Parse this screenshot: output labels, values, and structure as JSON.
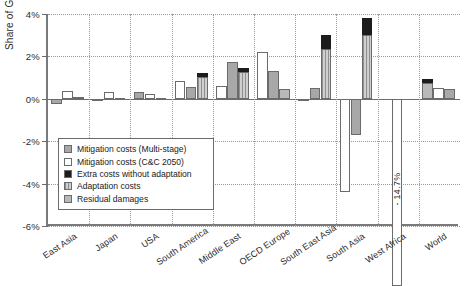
{
  "chart_data": {
    "type": "bar",
    "title": "",
    "xlabel": "",
    "ylabel": "Share of GDP",
    "ylim": [
      -6,
      4
    ],
    "ytick_labels": [
      "4%",
      "2%",
      "0%",
      "-2%",
      "-4%",
      "-6%"
    ],
    "ytick_values": [
      4,
      2,
      0,
      -2,
      -4,
      -6
    ],
    "grid": true,
    "legend_position": "lower-left-inside",
    "categories": [
      "East Asia",
      "Japan",
      "USA",
      "South America",
      "Middle East",
      "OECD Europe",
      "South East Asia",
      "South Asia",
      "West Africa",
      "World"
    ],
    "legend": [
      {
        "label": "Mitigation costs (Multi-stage)",
        "key": "mitms",
        "color": "#a8a8a8"
      },
      {
        "label": "Mitigation costs (C&C 2050)",
        "key": "cc",
        "color": "#ffffff"
      },
      {
        "label": "Extra costs without adaptation",
        "key": "extra",
        "color": "#1c1c1c"
      },
      {
        "label": "Adaptation costs",
        "key": "adapt",
        "color": "#cfcfcf"
      },
      {
        "label": "Residual damages",
        "key": "resid",
        "color": "#b9b9b9"
      }
    ],
    "series": [
      {
        "name": "Mitigation costs (Multi-stage)",
        "key": "mitms",
        "values": [
          -0.25,
          -0.08,
          0.25,
          0.55,
          0.8,
          0.5,
          0.5,
          -1.7,
          0.05,
          0.45
        ]
      },
      {
        "name": "Mitigation costs (C&C 2050)",
        "key": "cc",
        "values": [
          0.35,
          0.3,
          0.85,
          0.0,
          1.75,
          1.15,
          -0.1,
          -4.4,
          -14.7,
          0.5
        ]
      },
      {
        "name": "Adaptation costs",
        "key": "adapt",
        "values": [
          0.0,
          0.0,
          0.0,
          0.85,
          1.2,
          1.45,
          2.7,
          3.1,
          0.0,
          0.0
        ]
      },
      {
        "name": "Residual damages",
        "key": "resid",
        "values": [
          0.0,
          0.0,
          0.0,
          0.0,
          0.0,
          0.0,
          0.0,
          0.0,
          0.0,
          0.85
        ]
      },
      {
        "name": "Extra costs without adaptation",
        "key": "extra",
        "values": [
          0.0,
          0.0,
          0.0,
          0.0,
          0.35,
          0.2,
          0.9,
          0.7,
          0.0,
          0.2
        ]
      }
    ],
    "groups": [
      {
        "category": "East Asia",
        "bars": [
          {
            "key": "mitms",
            "base": 0,
            "top": -0.25
          },
          {
            "key": "cc",
            "base": 0,
            "top": 0.35
          },
          {
            "key": "resid",
            "base": 0,
            "top": 0.1
          }
        ]
      },
      {
        "category": "Japan",
        "bars": [
          {
            "key": "mitms",
            "base": 0,
            "top": -0.05
          },
          {
            "key": "cc",
            "base": 0,
            "top": 0.3
          },
          {
            "key": "resid",
            "base": 0,
            "top": 0.05
          }
        ]
      },
      {
        "category": "USA",
        "bars": [
          {
            "key": "mitms",
            "base": 0,
            "top": 0.3
          },
          {
            "key": "cc",
            "base": 0,
            "top": 0.25
          },
          {
            "key": "resid",
            "base": 0,
            "top": 0.05
          }
        ]
      },
      {
        "category": "South America",
        "bars": [
          {
            "key": "cc",
            "base": 0,
            "top": 0.85
          },
          {
            "key": "mitms",
            "base": 0,
            "top": 0.55
          },
          {
            "key": "stack_adapt_extra",
            "base": 0,
            "adapt_top": 1.05,
            "extra_top": 1.2
          }
        ]
      },
      {
        "category": "Middle East",
        "bars": [
          {
            "key": "cc",
            "base": 0,
            "top": 0.6
          },
          {
            "key": "mitms",
            "base": 0,
            "top": 1.75
          },
          {
            "key": "stack_adapt_extra",
            "base": 0,
            "adapt_top": 1.25,
            "extra_top": 1.45
          }
        ]
      },
      {
        "category": "OECD Europe",
        "bars": [
          {
            "key": "cc",
            "base": 0,
            "top": 2.2
          },
          {
            "key": "mitms",
            "base": 0,
            "top": 1.3
          },
          {
            "key": "resid",
            "base": 0,
            "top": 0.45
          }
        ]
      },
      {
        "category": "South East Asia",
        "bars": [
          {
            "key": "cc",
            "base": 0,
            "top": -0.1
          },
          {
            "key": "mitms",
            "base": 0,
            "top": 0.5
          },
          {
            "key": "stack_adapt_extra",
            "base": 0,
            "adapt_top": 2.35,
            "extra_top": 3.0
          }
        ]
      },
      {
        "category": "South Asia",
        "bars": [
          {
            "key": "cc",
            "base": 0,
            "top": -4.4
          },
          {
            "key": "mitms",
            "base": 0,
            "top": -1.7
          },
          {
            "key": "stack_adapt_extra",
            "base": 0,
            "adapt_top": 3.0,
            "extra_top": 3.8
          }
        ]
      },
      {
        "category": "West Africa",
        "bars": [
          {
            "key": "cc",
            "base": 0,
            "top": -14.7,
            "annotation": "- 14.7%"
          }
        ]
      },
      {
        "category": "World",
        "bars": [
          {
            "key": "stack_resid_extra",
            "base": 0,
            "resid_top": 0.75,
            "extra_top": 0.95
          },
          {
            "key": "cc",
            "base": 0,
            "top": 0.5
          },
          {
            "key": "mitms",
            "base": 0,
            "top": 0.45
          }
        ]
      }
    ],
    "annotations": [
      {
        "text": "- 14.7%",
        "category": "West Africa",
        "orientation": "vertical"
      }
    ]
  }
}
